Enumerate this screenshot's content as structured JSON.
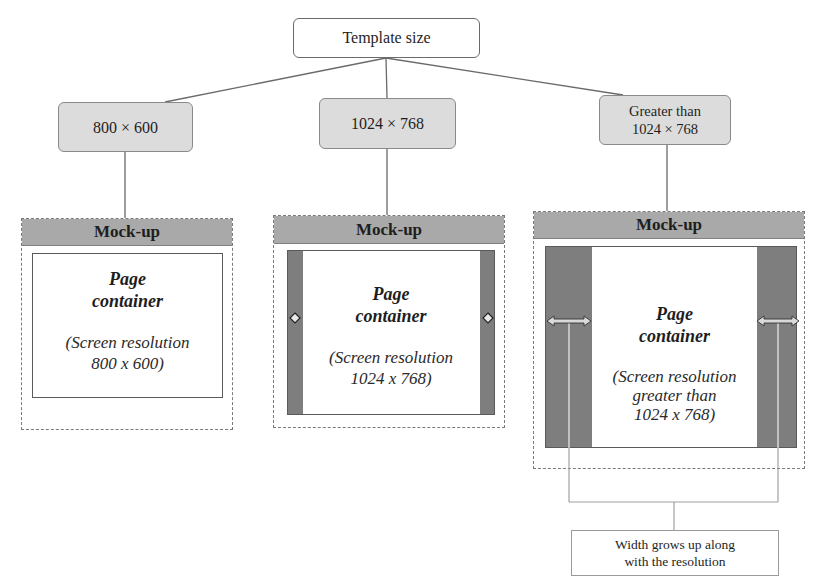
{
  "root": {
    "label": "Template size"
  },
  "branches": [
    {
      "size_lines": [
        "800 × 600"
      ],
      "mockup": {
        "header": "Mock-up",
        "title_lines": [
          "Page",
          "container"
        ],
        "subtitle_lines": [
          "(Screen resolution",
          "800 x 600)"
        ],
        "side_bars": "none"
      }
    },
    {
      "size_lines": [
        "1024 × 768"
      ],
      "mockup": {
        "header": "Mock-up",
        "title_lines": [
          "Page",
          "container"
        ],
        "subtitle_lines": [
          "(Screen resolution",
          "1024 x 768)"
        ],
        "side_bars": "narrow",
        "handle_icon": "diamond"
      }
    },
    {
      "size_lines": [
        "Greater than",
        "1024 × 768"
      ],
      "mockup": {
        "header": "Mock-up",
        "title_lines": [
          "Page",
          "container"
        ],
        "subtitle_lines": [
          "(Screen resolution",
          "greater than",
          "1024 x 768)"
        ],
        "side_bars": "wide",
        "handle_icon": "double-arrow"
      }
    }
  ],
  "note": {
    "lines": [
      "Width grows up along",
      "with the resolution"
    ]
  },
  "colors": {
    "size_box_fill": "#dcdcdc",
    "mockup_header_fill": "#a9a9a9",
    "side_bar_fill": "#7e7e7e",
    "line": "#6a6a6a"
  }
}
